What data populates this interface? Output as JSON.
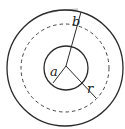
{
  "diagram": {
    "labels": {
      "inner_radius": "a",
      "outer_radius": "b",
      "surface_radius": "r"
    },
    "colors": {
      "stroke": "#2a2a2a",
      "background": "#ffffff"
    }
  }
}
